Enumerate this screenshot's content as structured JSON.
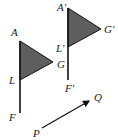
{
  "figure": {
    "colors": {
      "flag_fill": "#5e5e5e",
      "stroke": "#111111",
      "background": "#ffffff"
    },
    "original_flag": {
      "labels": {
        "A": "A",
        "G": "G",
        "L": "L",
        "F": "F"
      }
    },
    "image_flag": {
      "labels": {
        "A": "A'",
        "G": "G'",
        "L": "L'",
        "F": "F'"
      }
    },
    "vector": {
      "labels": {
        "start": "P",
        "end": "Q"
      }
    }
  }
}
